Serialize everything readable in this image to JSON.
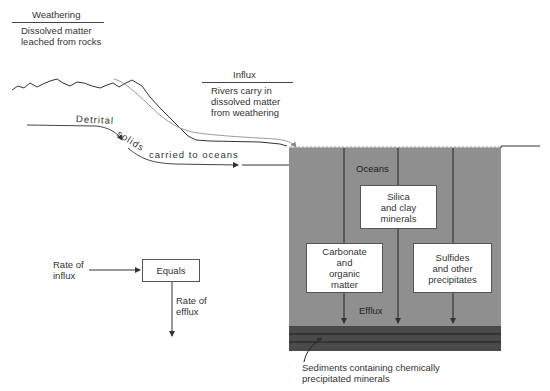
{
  "weathering": {
    "title": "Weathering",
    "line1": "Dissolved matter",
    "line2": "leached from rocks"
  },
  "influx": {
    "title": "Influx",
    "line1": "Rivers carry in",
    "line2": "dissolved matter",
    "line3": "from weathering"
  },
  "detrital": {
    "part1": "Detrital",
    "part2": "solids",
    "part3": "carried to oceans"
  },
  "ocean": {
    "label": "Oceans",
    "efflux": "Efflux",
    "boxes": [
      {
        "lines": [
          "Silica",
          "and clay",
          "minerals"
        ]
      },
      {
        "lines": [
          "Carbonate",
          "and",
          "organic",
          "matter"
        ]
      },
      {
        "lines": [
          "Sulfides",
          "and other",
          "precipitates"
        ]
      }
    ],
    "colors": {
      "water": "#8f8f8f",
      "sediment": "#4a4a4a",
      "sediment_lines": "#1e1e1e"
    }
  },
  "sediments": {
    "line1": "Sediments containing chemically",
    "line2": "precipitated minerals"
  },
  "balance": {
    "influx_line1": "Rate of",
    "influx_line2": "influx",
    "equals": "Equals",
    "efflux_line1": "Rate of",
    "efflux_line2": "efflux"
  }
}
